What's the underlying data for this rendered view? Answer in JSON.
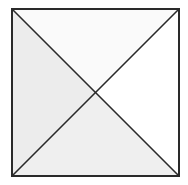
{
  "diagram": {
    "type": "square-with-diagonals",
    "square": {
      "x": 12,
      "y": 9,
      "size": 167
    },
    "border_color": "#2a2a2a",
    "line_color": "#2a2a2a",
    "colors": {
      "top": "#fafafa",
      "right": "#ffffff",
      "bottom": "#efefef",
      "left": "#ececec"
    }
  }
}
